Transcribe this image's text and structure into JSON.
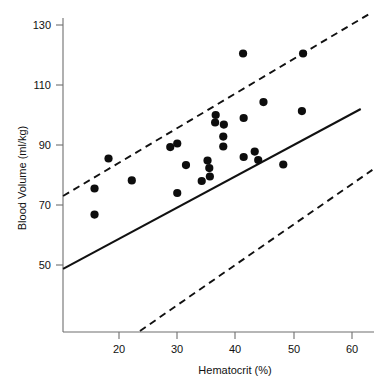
{
  "chart_data": {
    "type": "scatter",
    "title": "",
    "subtitle": "",
    "xlabel": "Hematocrit (%)",
    "ylabel": "Blood Volume (ml/kg)",
    "xlim": [
      10,
      62
    ],
    "ylim": [
      28,
      133
    ],
    "xticks": [
      20,
      30,
      40,
      50,
      60
    ],
    "yticks": [
      50,
      70,
      90,
      110,
      130
    ],
    "xtick_labels": [
      "20",
      "30",
      "40",
      "50",
      "60"
    ],
    "ytick_labels": [
      "50",
      "70",
      "90",
      "110",
      "130"
    ],
    "grid": false,
    "legend": null,
    "legend_position": "none",
    "marker": "filled-circle",
    "marker_color": "#0d0d0d",
    "marker_size_px": 5,
    "points": [
      {
        "x": 15.8,
        "y": 75.5
      },
      {
        "x": 15.8,
        "y": 66.8
      },
      {
        "x": 18.2,
        "y": 85.5
      },
      {
        "x": 22.2,
        "y": 78.2
      },
      {
        "x": 28.8,
        "y": 89.3
      },
      {
        "x": 30.0,
        "y": 90.5
      },
      {
        "x": 30.0,
        "y": 74.0
      },
      {
        "x": 31.5,
        "y": 83.3
      },
      {
        "x": 34.2,
        "y": 78.0
      },
      {
        "x": 35.2,
        "y": 84.8
      },
      {
        "x": 35.5,
        "y": 82.3
      },
      {
        "x": 35.6,
        "y": 79.5
      },
      {
        "x": 36.5,
        "y": 97.5
      },
      {
        "x": 36.6,
        "y": 100.0
      },
      {
        "x": 37.9,
        "y": 92.8
      },
      {
        "x": 38.0,
        "y": 96.8
      },
      {
        "x": 37.9,
        "y": 89.5
      },
      {
        "x": 41.3,
        "y": 120.5
      },
      {
        "x": 41.4,
        "y": 99.0
      },
      {
        "x": 41.4,
        "y": 86.0
      },
      {
        "x": 43.3,
        "y": 87.8
      },
      {
        "x": 43.9,
        "y": 85.0
      },
      {
        "x": 44.8,
        "y": 104.3
      },
      {
        "x": 48.2,
        "y": 83.5
      },
      {
        "x": 51.4,
        "y": 101.3
      },
      {
        "x": 51.6,
        "y": 120.5
      }
    ],
    "lines": [
      {
        "name": "regression-line",
        "style": "solid",
        "color": "#111111",
        "from": {
          "x": 10.4,
          "y": 48.7
        },
        "to": {
          "x": 61.5,
          "y": 102.0
        }
      },
      {
        "name": "upper-limit-line",
        "style": "dashed",
        "color": "#111111",
        "from": {
          "x": 10.4,
          "y": 73.0
        },
        "to": {
          "x": 63.5,
          "y": 134.3
        }
      },
      {
        "name": "lower-limit-line",
        "style": "dashed",
        "color": "#111111",
        "from": {
          "x": 23.6,
          "y": 28.0
        },
        "to": {
          "x": 63.5,
          "y": 81.7
        }
      }
    ]
  }
}
